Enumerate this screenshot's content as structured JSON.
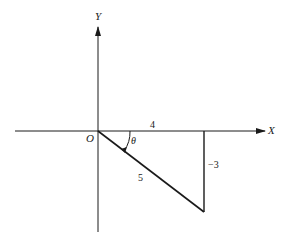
{
  "diagram": {
    "axes": {
      "x_label": "X",
      "y_label": "Y",
      "origin_label": "O"
    },
    "triangle": {
      "adjacent_label": "4",
      "opposite_label": "−3",
      "hypotenuse_label": "5",
      "angle_label": "θ"
    },
    "colors": {
      "stroke": "#1a1a1a",
      "background": "#ffffff"
    }
  }
}
